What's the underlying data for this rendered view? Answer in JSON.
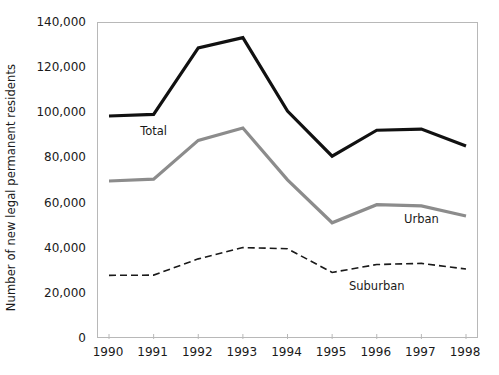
{
  "chart_data": {
    "type": "line",
    "title": "",
    "xlabel": "",
    "ylabel": "Number of new legal permanent residents",
    "categories": [
      "1990",
      "1991",
      "1992",
      "1993",
      "1994",
      "1995",
      "1996",
      "1997",
      "1998"
    ],
    "ylim": [
      0,
      140000
    ],
    "yticks": [
      0,
      20000,
      40000,
      60000,
      80000,
      100000,
      120000,
      140000
    ],
    "ytick_labels": [
      "0",
      "20,000",
      "40,000",
      "60,000",
      "80,000",
      "100,000",
      "120,000",
      "140,000"
    ],
    "grid": false,
    "legend_position": "inline-annotations",
    "series": [
      {
        "name": "Total",
        "style": "solid",
        "color": "#111111",
        "width": 3.2,
        "values": [
          98800,
          99500,
          129000,
          133500,
          101000,
          81000,
          92500,
          93000,
          85500
        ]
      },
      {
        "name": "Urban",
        "style": "solid",
        "color": "#8c8c8c",
        "width": 3.2,
        "values": [
          70000,
          70800,
          88000,
          93500,
          70500,
          51500,
          59500,
          59000,
          54500
        ]
      },
      {
        "name": "Suburban",
        "style": "dashed",
        "color": "#1a1a1a",
        "width": 1.6,
        "values": [
          28200,
          28300,
          35500,
          40500,
          40000,
          29500,
          33000,
          33500,
          31000
        ]
      }
    ],
    "annotations": [
      {
        "text": "Total",
        "category": "1991",
        "value": 92000
      },
      {
        "text": "Urban",
        "category": "1997",
        "value": 53000
      },
      {
        "text": "Suburban",
        "category": "1996",
        "value": 23500
      }
    ]
  }
}
